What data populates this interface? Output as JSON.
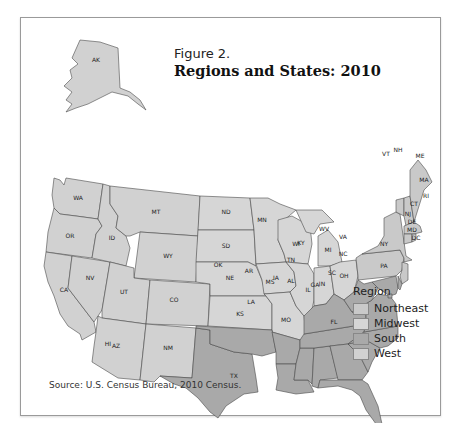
{
  "figure": {
    "label": "Figure 2.",
    "title": "Regions and States: 2010",
    "source": "Source: U.S. Census Bureau, 2010 Census."
  },
  "legend": {
    "title": "Region",
    "items": [
      {
        "name": "Northeast",
        "color": "#c9c9c9"
      },
      {
        "name": "Midwest",
        "color": "#d6d6d6"
      },
      {
        "name": "South",
        "color": "#a9a9a9"
      },
      {
        "name": "West",
        "color": "#d1d1d1"
      }
    ]
  },
  "states": {
    "West": [
      "AK",
      "HI",
      "WA",
      "OR",
      "CA",
      "NV",
      "ID",
      "MT",
      "WY",
      "UT",
      "CO",
      "AZ",
      "NM"
    ],
    "Midwest": [
      "ND",
      "SD",
      "NE",
      "KS",
      "MN",
      "IA",
      "MO",
      "WI",
      "IL",
      "MI",
      "IN",
      "OH"
    ],
    "South": [
      "TX",
      "OK",
      "AR",
      "LA",
      "MS",
      "AL",
      "TN",
      "KY",
      "GA",
      "FL",
      "SC",
      "NC",
      "VA",
      "WV",
      "MD",
      "DE",
      "DC"
    ],
    "Northeast": [
      "PA",
      "NY",
      "NJ",
      "CT",
      "RI",
      "MA",
      "VT",
      "NH",
      "ME"
    ]
  },
  "labels": {
    "AK": "AK",
    "HI": "HI",
    "WA": "WA",
    "OR": "OR",
    "CA": "CA",
    "NV": "NV",
    "ID": "ID",
    "MT": "MT",
    "WY": "WY",
    "UT": "UT",
    "CO": "CO",
    "AZ": "AZ",
    "NM": "NM",
    "ND": "ND",
    "SD": "SD",
    "NE": "NE",
    "KS": "KS",
    "MN": "MN",
    "IA": "IA",
    "MO": "MO",
    "WI": "WI",
    "IL": "IL",
    "MI": "MI",
    "IN": "IN",
    "OH": "OH",
    "TX": "TX",
    "OK": "OK",
    "AR": "AR",
    "LA": "LA",
    "MS": "MS",
    "AL": "AL",
    "TN": "TN",
    "KY": "KY",
    "GA": "GA",
    "FL": "FL",
    "SC": "SC",
    "NC": "NC",
    "VA": "VA",
    "WV": "WV",
    "MD": "MD",
    "DE": "DE",
    "DC": "DC",
    "PA": "PA",
    "NY": "NY",
    "NJ": "NJ",
    "CT": "CT",
    "RI": "RI",
    "MA": "MA",
    "VT": "VT",
    "NH": "NH",
    "ME": "ME"
  }
}
